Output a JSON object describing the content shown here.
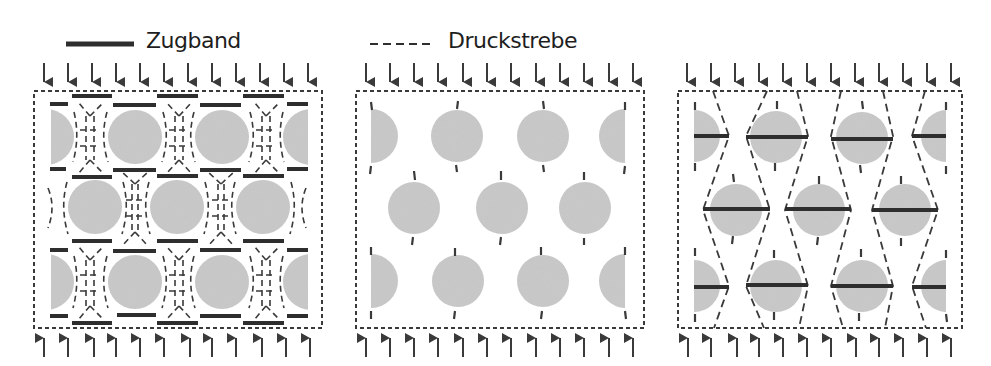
{
  "legend": {
    "tie_label": "Zugband",
    "strut_label": "Druckstrebe"
  },
  "colors": {
    "ink": "#3a3a3a",
    "tie": "#2e2e2e",
    "circle_fill": "#c4c4c4",
    "background": "#ffffff"
  },
  "panels": [
    {
      "name": "panel-strut-and-tie-dense",
      "description": "Dense strut-and-tie model around circular voids",
      "bounds": {
        "x": 34,
        "y": 91,
        "w": 288,
        "h": 237
      },
      "arrows_top": 12,
      "arrows_bottom": 12
    },
    {
      "name": "panel-voids-only",
      "description": "Voids with small tick marks",
      "bounds": {
        "x": 356,
        "y": 91,
        "w": 288,
        "h": 237
      },
      "arrows_top": 12,
      "arrows_bottom": 12
    },
    {
      "name": "panel-simplified-strut-and-tie",
      "description": "Simplified hexagonal strut-and-tie model",
      "bounds": {
        "x": 678,
        "y": 91,
        "w": 284,
        "h": 237
      },
      "arrows_top": 12,
      "arrows_bottom": 12
    }
  ]
}
